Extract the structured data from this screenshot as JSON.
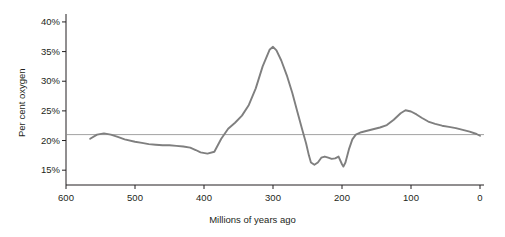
{
  "chart_data": {
    "type": "line",
    "title": "",
    "xlabel": "Millions of years ago",
    "ylabel": "Per cent oxygen",
    "xlim": [
      600,
      0
    ],
    "ylim": [
      12.5,
      41
    ],
    "x_ticks": [
      600,
      500,
      400,
      300,
      200,
      100,
      0
    ],
    "x_tick_labels": [
      "600",
      "500",
      "400",
      "300",
      "200",
      "100",
      "0"
    ],
    "y_ticks": [
      15,
      20,
      25,
      30,
      35,
      40
    ],
    "y_tick_labels": [
      "15%",
      "20%",
      "25%",
      "30%",
      "35%",
      "40%"
    ],
    "grid": false,
    "reference_line": {
      "y": 21,
      "label": "",
      "color": "#8a8a8a"
    },
    "legend": null,
    "series": [
      {
        "name": "Atmospheric oxygen",
        "color": "#7f7f7f",
        "x": [
          565,
          555,
          545,
          535,
          525,
          515,
          500,
          490,
          480,
          470,
          460,
          450,
          440,
          430,
          420,
          412,
          405,
          395,
          385,
          375,
          365,
          355,
          345,
          335,
          325,
          315,
          305,
          300,
          295,
          288,
          280,
          272,
          265,
          258,
          252,
          248,
          245,
          240,
          235,
          230,
          225,
          220,
          215,
          210,
          205,
          200,
          198,
          195,
          190,
          185,
          180,
          172,
          165,
          155,
          145,
          135,
          125,
          115,
          108,
          100,
          92,
          84,
          75,
          65,
          55,
          45,
          35,
          25,
          15,
          5,
          0
        ],
        "y": [
          20.3,
          21.0,
          21.2,
          21.0,
          20.6,
          20.2,
          19.8,
          19.6,
          19.4,
          19.3,
          19.2,
          19.2,
          19.1,
          19.0,
          18.8,
          18.4,
          18.0,
          17.8,
          18.1,
          20.3,
          22.0,
          23.0,
          24.2,
          26.0,
          28.8,
          32.5,
          35.3,
          35.8,
          35.2,
          33.5,
          31.0,
          28.0,
          25.0,
          22.0,
          19.5,
          17.5,
          16.3,
          15.9,
          16.3,
          17.1,
          17.3,
          17.1,
          16.9,
          17.0,
          17.3,
          16.0,
          15.6,
          16.3,
          18.5,
          20.2,
          21.0,
          21.4,
          21.6,
          21.9,
          22.2,
          22.6,
          23.5,
          24.6,
          25.1,
          24.9,
          24.4,
          23.8,
          23.2,
          22.8,
          22.5,
          22.3,
          22.1,
          21.8,
          21.5,
          21.1,
          20.8
        ]
      }
    ]
  },
  "axes": {
    "y_label": "Per cent oxygen",
    "x_label": "Millions of years ago"
  }
}
